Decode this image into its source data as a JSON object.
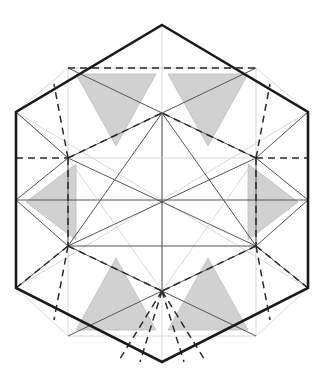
{
  "figure": {
    "caption": "",
    "canvas": {
      "width": 324,
      "height": 388,
      "background": "#ffffff"
    },
    "colors": {
      "outline": "#1a1a1a",
      "solid_construction": "#555555",
      "faint_construction": "#d2d2d2",
      "dashed": "#2a2a2a",
      "shading_fill": "#c9c9c9",
      "shading_stroke": "#bdbdbd"
    },
    "stroke_widths": {
      "outline": 2.6,
      "solid_construction": 1.0,
      "faint_construction": 0.9,
      "dashed": 1.5
    },
    "dash_pattern": "7,5"
  },
  "geometry": {
    "outer_hexagon": {
      "name": "outer-hexagon",
      "points": "162,25 308,112 308,288 162,362 16,288 16,112",
      "vertices": [
        {
          "label": "top",
          "x": 162,
          "y": 25
        },
        {
          "label": "upper-right",
          "x": 308,
          "y": 112
        },
        {
          "label": "lower-right",
          "x": 308,
          "y": 288
        },
        {
          "label": "bottom",
          "x": 162,
          "y": 362
        },
        {
          "label": "lower-left",
          "x": 16,
          "y": 288
        },
        {
          "label": "upper-left",
          "x": 16,
          "y": 112
        }
      ]
    },
    "inner_hexagon": {
      "name": "inner-hexagon",
      "points": "162,113 256,158 256,246 162,291 68,246 68,158",
      "vertices": [
        {
          "label": "inner-top",
          "x": 162,
          "y": 113
        },
        {
          "label": "inner-upper-right",
          "x": 256,
          "y": 158
        },
        {
          "label": "inner-lower-right",
          "x": 256,
          "y": 246
        },
        {
          "label": "inner-bottom",
          "x": 162,
          "y": 291
        },
        {
          "label": "inner-lower-left",
          "x": 68,
          "y": 246
        },
        {
          "label": "inner-upper-left",
          "x": 68,
          "y": 158
        }
      ]
    },
    "central_triangle": {
      "name": "central-triangle",
      "points": "162,113 256,246 68,246"
    },
    "inverted_triangle": {
      "name": "inverted-central-triangle",
      "points": "162,291 68,158 256,158"
    },
    "solid_lines": [
      {
        "name": "hex-long-diagonal-horizontal",
        "x1": 16,
        "y1": 200,
        "x2": 308,
        "y2": 200
      },
      {
        "name": "median-upper-left-to-lower-right",
        "x1": 68,
        "y1": 158,
        "x2": 256,
        "y2": 246
      },
      {
        "name": "median-upper-right-to-lower-left",
        "x1": 256,
        "y1": 158,
        "x2": 68,
        "y2": 246
      },
      {
        "name": "inner-top-to-center",
        "x1": 162,
        "y1": 113,
        "x2": 162,
        "y2": 291
      },
      {
        "name": "left-edge-spoke-upper",
        "x1": 16,
        "y1": 112,
        "x2": 68,
        "y2": 158
      },
      {
        "name": "right-edge-spoke-upper",
        "x1": 308,
        "y1": 112,
        "x2": 256,
        "y2": 158
      },
      {
        "name": "left-edge-spoke-lower",
        "x1": 16,
        "y1": 288,
        "x2": 68,
        "y2": 246
      },
      {
        "name": "right-edge-spoke-lower",
        "x1": 308,
        "y1": 288,
        "x2": 256,
        "y2": 246
      },
      {
        "name": "top-ridge-left",
        "x1": 68,
        "y1": 68,
        "x2": 162,
        "y2": 113
      },
      {
        "name": "top-ridge-right",
        "x1": 256,
        "y1": 68,
        "x2": 162,
        "y2": 113
      },
      {
        "name": "bottom-ridge-left",
        "x1": 68,
        "y1": 336,
        "x2": 162,
        "y2": 291
      },
      {
        "name": "bottom-ridge-right",
        "x1": 256,
        "y1": 336,
        "x2": 162,
        "y2": 291
      },
      {
        "name": "left-band-top",
        "x1": 16,
        "y1": 200,
        "x2": 68,
        "y2": 158
      },
      {
        "name": "left-band-bottom",
        "x1": 16,
        "y1": 200,
        "x2": 68,
        "y2": 246
      },
      {
        "name": "right-band-top",
        "x1": 308,
        "y1": 200,
        "x2": 256,
        "y2": 158
      },
      {
        "name": "right-band-bottom",
        "x1": 308,
        "y1": 200,
        "x2": 256,
        "y2": 246
      }
    ],
    "faint_lines": [
      {
        "name": "faint-upper-left-edge-chord",
        "x1": 16,
        "y1": 112,
        "x2": 68,
        "y2": 158
      },
      {
        "name": "faint-vertical-axis",
        "x1": 162,
        "y1": 25,
        "x2": 162,
        "y2": 362
      },
      {
        "name": "faint-left-vertical",
        "x1": 68,
        "y1": 68,
        "x2": 68,
        "y2": 336
      },
      {
        "name": "faint-right-vertical",
        "x1": 256,
        "y1": 68,
        "x2": 256,
        "y2": 336
      },
      {
        "name": "faint-upper-left-diag",
        "x1": 16,
        "y1": 112,
        "x2": 162,
        "y2": 200
      },
      {
        "name": "faint-upper-right-diag",
        "x1": 308,
        "y1": 112,
        "x2": 162,
        "y2": 200
      },
      {
        "name": "faint-lower-left-diag",
        "x1": 16,
        "y1": 288,
        "x2": 162,
        "y2": 200
      },
      {
        "name": "faint-lower-right-diag",
        "x1": 308,
        "y1": 288,
        "x2": 162,
        "y2": 200
      },
      {
        "name": "faint-top-band-left",
        "x1": 68,
        "y1": 68,
        "x2": 16,
        "y2": 112
      },
      {
        "name": "faint-top-band-right",
        "x1": 256,
        "y1": 68,
        "x2": 308,
        "y2": 112
      },
      {
        "name": "faint-bottom-band-left",
        "x1": 68,
        "y1": 336,
        "x2": 16,
        "y2": 288
      },
      {
        "name": "faint-bottom-band-right",
        "x1": 256,
        "y1": 336,
        "x2": 308,
        "y2": 288
      },
      {
        "name": "faint-top-shelf",
        "x1": 68,
        "y1": 68,
        "x2": 256,
        "y2": 68
      },
      {
        "name": "faint-bottom-shelf",
        "x1": 68,
        "y1": 336,
        "x2": 256,
        "y2": 336
      }
    ],
    "dashed_lines": [
      {
        "name": "dashed-top-horizontal",
        "x1": 68,
        "y1": 68,
        "x2": 256,
        "y2": 68
      },
      {
        "name": "dashed-left-horizontal",
        "x1": 16,
        "y1": 158,
        "x2": 68,
        "y2": 158
      },
      {
        "name": "dashed-right-horizontal",
        "x1": 256,
        "y1": 158,
        "x2": 308,
        "y2": 158
      },
      {
        "name": "dashed-upper-left-to-center",
        "x1": 68,
        "y1": 158,
        "x2": 162,
        "y2": 113
      },
      {
        "name": "dashed-upper-right-to-center",
        "x1": 256,
        "y1": 158,
        "x2": 162,
        "y2": 113
      },
      {
        "name": "dashed-lower-left-to-center",
        "x1": 68,
        "y1": 246,
        "x2": 162,
        "y2": 291
      },
      {
        "name": "dashed-lower-right-to-center",
        "x1": 256,
        "y1": 246,
        "x2": 162,
        "y2": 291
      },
      {
        "name": "dashed-left-vertical-drop",
        "x1": 68,
        "y1": 158,
        "x2": 68,
        "y2": 246
      },
      {
        "name": "dashed-right-vertical-drop",
        "x1": 256,
        "y1": 158,
        "x2": 256,
        "y2": 246
      },
      {
        "name": "dashed-nw-corner-fan-a",
        "x1": 68,
        "y1": 158,
        "x2": 54,
        "y2": 84
      },
      {
        "name": "dashed-ne-corner-fan-a",
        "x1": 256,
        "y1": 158,
        "x2": 270,
        "y2": 84
      },
      {
        "name": "dashed-sw-corner-fan-a",
        "x1": 68,
        "y1": 246,
        "x2": 54,
        "y2": 320
      },
      {
        "name": "dashed-se-corner-fan-a",
        "x1": 256,
        "y1": 246,
        "x2": 270,
        "y2": 320
      },
      {
        "name": "dashed-sw-corner-fan-b",
        "x1": 68,
        "y1": 246,
        "x2": 16,
        "y2": 288
      },
      {
        "name": "dashed-se-corner-fan-b",
        "x1": 256,
        "y1": 246,
        "x2": 308,
        "y2": 288
      },
      {
        "name": "dashed-bottom-fan-1",
        "x1": 162,
        "y1": 291,
        "x2": 118,
        "y2": 362
      },
      {
        "name": "dashed-bottom-fan-2",
        "x1": 162,
        "y1": 291,
        "x2": 140,
        "y2": 362
      },
      {
        "name": "dashed-bottom-fan-3",
        "x1": 162,
        "y1": 291,
        "x2": 184,
        "y2": 362
      },
      {
        "name": "dashed-bottom-fan-4",
        "x1": 162,
        "y1": 291,
        "x2": 206,
        "y2": 362
      }
    ],
    "shaded_triangles": [
      {
        "name": "shaded-triangle-top-left",
        "points": "76,74 156,74 116,146",
        "orientation": "down"
      },
      {
        "name": "shaded-triangle-top-right",
        "points": "168,74 248,74 208,146",
        "orientation": "down"
      },
      {
        "name": "shaded-triangle-mid-left",
        "points": "76,164 76,240 26,202",
        "orientation": "left"
      },
      {
        "name": "shaded-triangle-mid-right",
        "points": "248,164 248,240 298,202",
        "orientation": "right"
      },
      {
        "name": "shaded-triangle-bottom-left",
        "points": "76,330 156,330 116,258",
        "orientation": "up"
      },
      {
        "name": "shaded-triangle-bottom-right",
        "points": "168,330 248,330 208,258",
        "orientation": "up"
      }
    ]
  }
}
